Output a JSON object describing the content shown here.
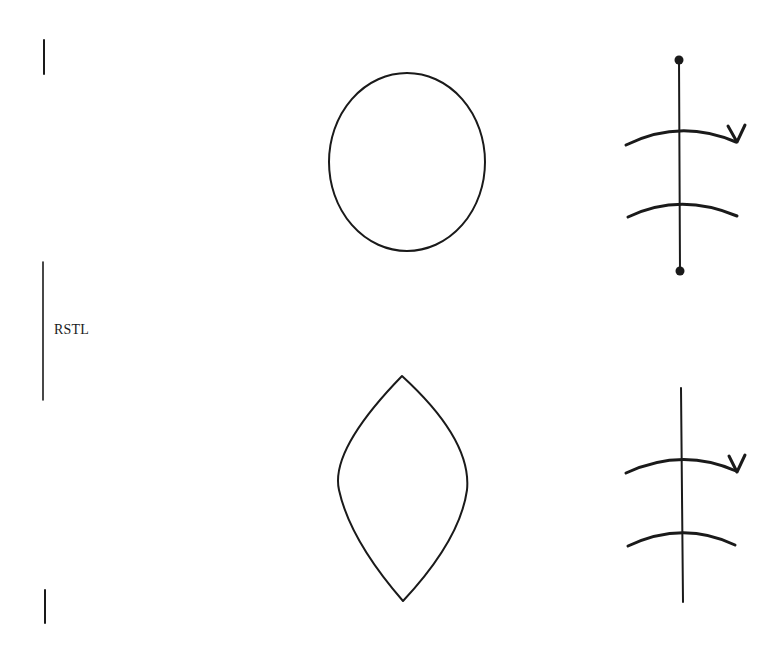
{
  "diagram": {
    "label": "RSTL",
    "stroke_color": "#1a1a1a",
    "background": "#ffffff",
    "rows": [
      {
        "name": "top",
        "shape": "circle",
        "description": "circular defect",
        "closure": {
          "suture_endpoints": "dots",
          "crossing_lines": 2,
          "arrowhead": "v"
        }
      },
      {
        "name": "bottom",
        "shape": "lens",
        "description": "elliptical (fusiform) excision",
        "closure": {
          "suture_endpoints": "none",
          "crossing_lines": 2,
          "arrowhead": "v"
        }
      }
    ]
  }
}
